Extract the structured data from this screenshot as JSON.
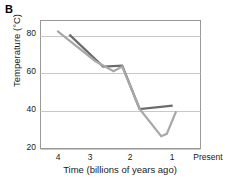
{
  "figure": {
    "panel_label": "B"
  },
  "chart_data": {
    "type": "line",
    "title": "",
    "panel": "B",
    "xlabel": "Time (billions of years ago)",
    "ylabel": "Temperature (°C)",
    "xlim": [
      4.35,
      -0.25
    ],
    "ylim": [
      20,
      88
    ],
    "x_axis_reversed": true,
    "grid": true,
    "grid_axis": "y",
    "legend": "none",
    "xticks": [
      4,
      3,
      2,
      1,
      0
    ],
    "xtick_labels": [
      "4",
      "3",
      "2",
      "1",
      "Present"
    ],
    "yticks": [
      20,
      40,
      60,
      80
    ],
    "ytick_labels": [
      "20",
      "40",
      "60",
      "80"
    ],
    "series": [
      {
        "name": "upper-estimate",
        "color": "#6b6b6b",
        "width": 2.2,
        "x": [
          3.52,
          2.55,
          2.0,
          1.5,
          0.55
        ],
        "values": [
          80.5,
          63.5,
          64.0,
          41.0,
          42.8
        ]
      },
      {
        "name": "lower-estimate",
        "color": "#a8a8a8",
        "width": 2.2,
        "x": [
          3.87,
          2.78,
          2.25,
          2.0,
          1.5,
          0.88,
          0.72,
          0.45
        ],
        "values": [
          82.5,
          66.5,
          61.0,
          63.5,
          41.0,
          26.5,
          27.8,
          39.8
        ]
      }
    ]
  },
  "axes": {
    "y_tick_values": [
      80,
      60,
      40,
      20
    ],
    "x_tick_values": [
      "4",
      "3",
      "2",
      "1",
      "Present"
    ]
  }
}
